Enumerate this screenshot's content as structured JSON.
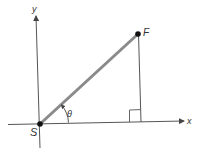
{
  "diagram": {
    "type": "vector-geometry",
    "axes": {
      "x_label": "x",
      "y_label": "y"
    },
    "points": [
      {
        "id": "S",
        "label": "S",
        "role": "origin"
      },
      {
        "id": "F",
        "label": "F",
        "role": "endpoint"
      }
    ],
    "segments": [
      {
        "from": "S",
        "to": "F",
        "style": "thick-gray",
        "description": "vector from S to F"
      },
      {
        "from": "F",
        "to": "foot",
        "style": "thin",
        "description": "perpendicular from F to x-axis"
      }
    ],
    "angle": {
      "label": "θ",
      "between": [
        "x-axis",
        "SF"
      ]
    },
    "right_angle_marker": true,
    "colors": {
      "vector": "#8a8a8a",
      "axis": "#555555",
      "point": "#111111"
    }
  }
}
